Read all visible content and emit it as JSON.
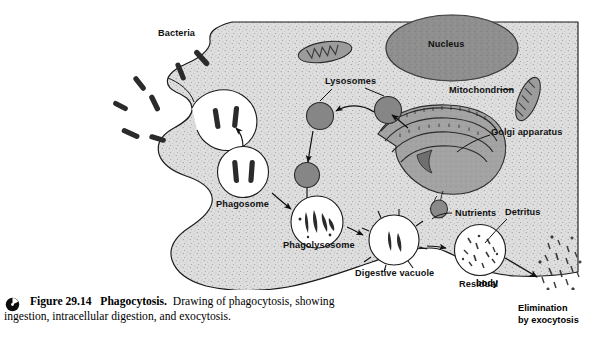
{
  "figure": {
    "number": "Figure 29.14",
    "title": "Phagocytosis.",
    "caption_line1": "Drawing of phagocytosis, showing",
    "caption_line2": "ingestion, intracellular digestion, and exocytosis.",
    "icon": "figure-marker-icon"
  },
  "labels": {
    "bacteria": "Bacteria",
    "phagosome": "Phagosome",
    "lysosomes": "Lysosomes",
    "nucleus": "Nucleus",
    "mitochondrion": "Mitochondrion",
    "golgi": "Golgi apparatus",
    "phagolysosome": "Phagolysosome",
    "digestive_vacuole": "Digestive vacuole",
    "nutrients": "Nutrients",
    "detritus": "Detritus",
    "residual_body_l1": "Residual",
    "residual_body_l2": "body",
    "elimination_l1": "Elimination",
    "elimination_l2": "by exocytosis"
  },
  "colors": {
    "cytoplasm": "#dcdcdc",
    "nucleus": "#8f8f8f",
    "lysosome": "#868686",
    "golgi": "#9a9a9a",
    "mitochondrion": "#9c9c9c",
    "vesicle_lumen": "#ffffff",
    "outline": "#1a1a1a",
    "bacteria": "#2b2b2b",
    "background": "#ffffff"
  },
  "process_steps": [
    "Bacteria approach cell surface",
    "Pseudopods engulf bacteria",
    "Phagosome forms",
    "Lysosomes fuse with phagosome",
    "Phagolysosome digests contents",
    "Digestive vacuole releases nutrients",
    "Residual body retains detritus",
    "Elimination by exocytosis"
  ]
}
